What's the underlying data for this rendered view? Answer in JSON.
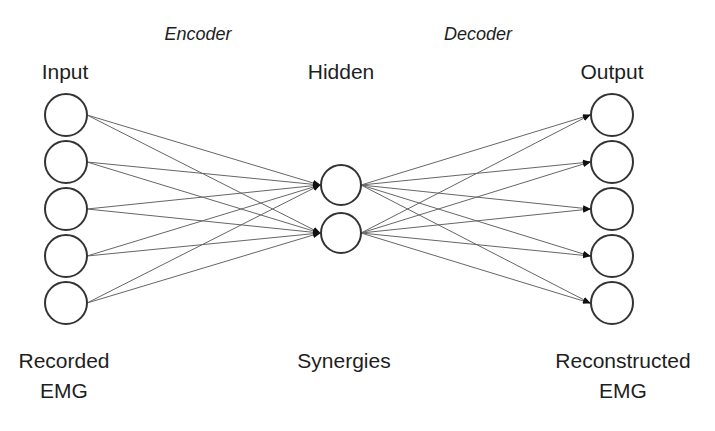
{
  "diagram": {
    "type": "autoencoder-network",
    "sections": {
      "encoder": "Encoder",
      "decoder": "Decoder"
    },
    "layers": [
      {
        "id": "input",
        "title": "Input",
        "caption": [
          "Recorded",
          "EMG"
        ],
        "node_count": 5
      },
      {
        "id": "hidden",
        "title": "Hidden",
        "caption": [
          "Synergies"
        ],
        "node_count": 2
      },
      {
        "id": "output",
        "title": "Output",
        "caption": [
          "Reconstructed",
          "EMG"
        ],
        "node_count": 5
      }
    ],
    "connections": "fully-connected input→hidden (encoder), hidden→output (decoder)",
    "colors": {
      "node_stroke": "#333333",
      "edge": "#666666",
      "arrow": "#111111",
      "text": "#1e1e1e"
    }
  }
}
